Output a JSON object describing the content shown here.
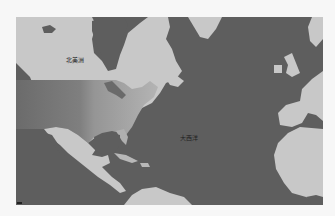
{
  "map": {
    "region": "North Atlantic",
    "labels": {
      "continent": "北美洲",
      "ocean": "大西洋"
    },
    "colors": {
      "ocean": "#5e5e5e",
      "land": "#c8c8c8",
      "choropleth_low": "#6b6b6b",
      "choropleth_mid": "#8f8f8f",
      "choropleth_high": "#b4b4b4",
      "background": "#f7f7f7"
    }
  }
}
